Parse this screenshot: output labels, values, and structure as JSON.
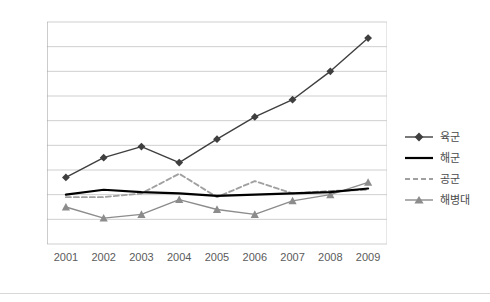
{
  "chart_data": {
    "type": "line",
    "title": "",
    "xlabel": "",
    "ylabel": "",
    "categories": [
      "2001",
      "2002",
      "2003",
      "2004",
      "2005",
      "2006",
      "2007",
      "2008",
      "2009"
    ],
    "ylim": [
      0,
      180
    ],
    "ytick_step": 20,
    "yticks": [
      "0",
      "20",
      "40",
      "60",
      "80",
      "100",
      "120",
      "140",
      "160",
      "180"
    ],
    "grid": "horizontal",
    "legend_position": "right",
    "series": [
      {
        "name": "육군",
        "marker": "diamond",
        "line_style": "solid",
        "color": "#3f3f3f",
        "values": [
          54,
          70,
          79,
          66,
          85,
          103,
          117,
          140,
          167
        ]
      },
      {
        "name": "해군",
        "marker": "none",
        "line_style": "solid",
        "color": "#000000",
        "values": [
          40,
          44,
          42,
          41,
          39,
          40,
          41,
          42,
          45
        ]
      },
      {
        "name": "공군",
        "marker": "none",
        "line_style": "dashed",
        "color": "#a0a0a0",
        "values": [
          38,
          38,
          41,
          57,
          38,
          51,
          41,
          43,
          44
        ]
      },
      {
        "name": "해병대",
        "marker": "triangle",
        "line_style": "solid",
        "color": "#8c8c8c",
        "values": [
          30,
          21,
          24,
          36,
          28,
          24,
          35,
          40,
          50
        ]
      }
    ]
  },
  "legend": {
    "items": [
      {
        "label": "육군"
      },
      {
        "label": "해군"
      },
      {
        "label": "공군"
      },
      {
        "label": "해병대"
      }
    ]
  }
}
